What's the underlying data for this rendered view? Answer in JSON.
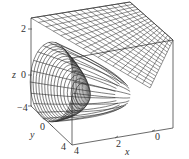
{
  "chart_data": {
    "type": "surface3d",
    "title": "",
    "surfaces": [
      {
        "name": "paraboloid",
        "kind": "wireframe",
        "axis_of_symmetry": "x"
      },
      {
        "name": "plane",
        "kind": "wireframe"
      }
    ],
    "axes": {
      "x": {
        "label": "x",
        "ticks": [
          "4",
          "2",
          "0"
        ]
      },
      "y": {
        "label": "y",
        "ticks": [
          "-4",
          "0",
          "4"
        ]
      },
      "z": {
        "label": "z",
        "ticks": [
          "2",
          "0",
          "-4"
        ]
      }
    },
    "xlim": [
      0,
      4
    ],
    "ylim": [
      -4,
      4
    ],
    "zlim": [
      -4,
      2
    ],
    "grid": false,
    "legend": null
  },
  "labels": {
    "z_axis": "z",
    "z_tick_top": "2",
    "z_tick_mid": "0",
    "z_tick_bottom": "−4",
    "y_axis": "y",
    "y_tick_back": "−4",
    "y_tick_mid": "0",
    "y_tick_front": "4",
    "x_axis": "x",
    "x_tick_front": "4",
    "x_tick_mid": "2",
    "x_tick_back": "0"
  },
  "colors": {
    "line": "#333333",
    "mesh": "#2a2a2a",
    "background": "#ffffff"
  }
}
